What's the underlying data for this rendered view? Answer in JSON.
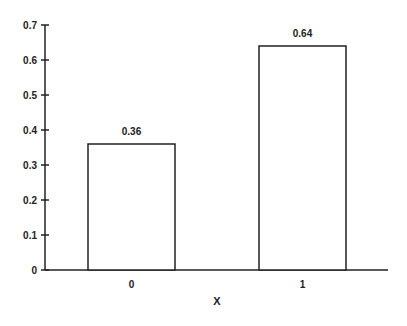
{
  "chart_data": {
    "type": "bar",
    "title": "",
    "xlabel": "X",
    "ylabel": "",
    "categories": [
      "0",
      "1"
    ],
    "values": [
      0.36,
      0.64
    ],
    "data_labels": [
      "0.36",
      "0.64"
    ],
    "ylim": [
      0,
      0.7
    ],
    "yticks": [
      "0",
      "0.1",
      "0.2",
      "0.3",
      "0.4",
      "0.5",
      "0.6",
      "0.7"
    ],
    "grid": false,
    "legend": null,
    "bar_fill": "#ffffff",
    "bar_stroke": "#222222"
  }
}
